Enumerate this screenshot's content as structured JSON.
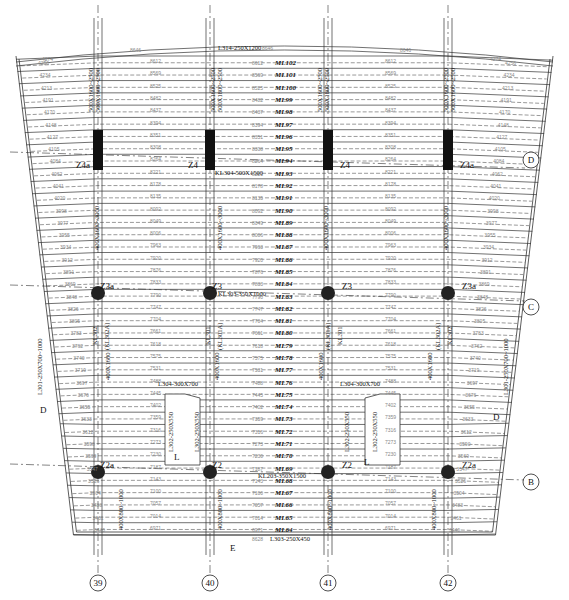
{
  "drawing": {
    "type": "structural floor framing plan",
    "top_beam_label": "L314-250X1200",
    "bottom_beam_label": "L303-250X450",
    "kl_d_label": "KL304-500X1500",
    "kl_c_label": "KL303-350X1000",
    "kl_b_label": "KL203-350X1500",
    "left_edge_beam": "L301-250X700~1000",
    "right_edge_beam": "L301-250X700~1000",
    "left_l304": "L304-300X700",
    "right_l304": "L304-300X700",
    "left_l302": "L302-250X550",
    "right_l302": "L302-250X550",
    "left_opening_l302b": "L302-250X550",
    "right_opening_l302b": "L302-250X550",
    "kl302_left": "KL302",
    "kl302_left_alt": "(KL302A)",
    "kl301_mid_left": "KL301",
    "kl301_mid_left_alt": "(KL301A)",
    "kl301_mid_right": "KL301",
    "kl301_mid_right_alt": "(KL301A)",
    "kl302_right": "KL302",
    "kl302_right_alt": "(KL302A)",
    "col_beam_top_outer": "500X1600~2500",
    "col_beam_top_outer2": "500X1600~2500",
    "col_beam_top_inner": "500X1600~2500",
    "col_beam_top_inner2": "500X1800~2500",
    "col_beam_mid": "400X1600~3000",
    "col_beam_lower": "400X1600",
    "col_beam_bottom": "400X800~1000",
    "section_marks": {
      "d": "D",
      "e": "E",
      "l": "L"
    },
    "dim_top_span": "8646",
    "dim_top_side": "4274",
    "dim_bottom": "8628"
  },
  "ml_labels": [
    "ML102",
    "ML101",
    "ML100",
    "ML99",
    "ML98",
    "ML97",
    "ML96",
    "ML95",
    "ML94",
    "ML93",
    "ML92",
    "ML91",
    "ML90",
    "ML89",
    "ML88",
    "ML87",
    "ML86",
    "ML85",
    "ML84",
    "ML83",
    "ML82",
    "ML81",
    "ML80",
    "ML79",
    "ML78",
    "ML77",
    "ML76",
    "ML75",
    "ML74",
    "ML73",
    "ML72",
    "ML71",
    "ML70",
    "ML69",
    "ML68",
    "ML67",
    "ML66",
    "ML65",
    "ML64"
  ],
  "mid_dims": [
    "8612",
    "8569",
    "8525",
    "8482",
    "8437",
    "8394",
    "8351",
    "8308",
    "8264",
    "8221",
    "8178",
    "8135",
    "8092",
    "8049",
    "8006",
    "7963",
    "7920",
    "7876",
    "7833",
    "7790",
    "7747",
    "7704",
    "7661",
    "7618",
    "7575",
    "7531",
    "7488",
    "7445",
    "7402",
    "7359",
    "7316",
    "7273",
    "7230",
    "7187",
    "7143",
    "7100",
    "7057",
    "7014",
    "6971"
  ],
  "side_dims": [
    "4256",
    "4234",
    "4213",
    "4191",
    "4170",
    "4148",
    "4127",
    "4105",
    "4084",
    "4062",
    "4041",
    "4020",
    "3998",
    "3977",
    "3955",
    "3934",
    "3912",
    "3891",
    "3869",
    "3848",
    "3826",
    "3805",
    "3783",
    "3762",
    "3740",
    "3719",
    "3697",
    "3676",
    "3655",
    "3633",
    "3612",
    "3590",
    "3569",
    "3547",
    "3526",
    "3504",
    "3483",
    "3461",
    "3440"
  ],
  "columns": {
    "d": [
      "Z4a",
      "Z4",
      "Z4",
      "Z4a"
    ],
    "c": [
      "Z3a",
      "Z3",
      "Z3",
      "Z3a"
    ],
    "b": [
      "Z2a",
      "Z2",
      "Z2",
      "Z2a"
    ]
  },
  "axes": {
    "vertical": [
      "39",
      "40",
      "41",
      "42"
    ],
    "horizontal": [
      "D",
      "C",
      "B"
    ]
  }
}
